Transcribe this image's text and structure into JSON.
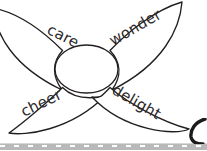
{
  "document": {
    "title": "Petal word diagram",
    "background_color": "#ffffff",
    "line_color": "#231f20",
    "text_color": "#2d2a2b"
  },
  "diagram": {
    "type": "four-petal flower word map",
    "center": {
      "label": "",
      "shape": "ellipse",
      "cx": 86.5,
      "cy": 69,
      "rx": 31.5,
      "ry": 24
    },
    "petals": [
      {
        "id": "petal-care",
        "label": "care",
        "position": "top-left",
        "rotation_deg": 27,
        "label_x": 46,
        "label_y": 33,
        "tip_x": -6,
        "tip_y": 9
      },
      {
        "id": "petal-wonder",
        "label": "wonder",
        "position": "top-right",
        "rotation_deg": -30,
        "label_x": 113,
        "label_y": 46,
        "tip_x": 181,
        "tip_y": 3
      },
      {
        "id": "petal-cheer",
        "label": "cheer",
        "position": "bottom-left",
        "rotation_deg": -26,
        "label_x": 24,
        "label_y": 117,
        "tip_x": 9,
        "tip_y": 133
      },
      {
        "id": "petal-delight",
        "label": "delight",
        "position": "bottom-right",
        "rotation_deg": 30,
        "label_x": 111,
        "label_y": 93,
        "tip_x": 189,
        "tip_y": 129
      }
    ]
  },
  "footer": {
    "strip_color": "#b9b9b9",
    "dash_color": "#ffffff",
    "y": 143,
    "height": 7
  },
  "corner_mark": {
    "name": "partial-circle-glyph",
    "color": "#1b1b1b",
    "x": 189,
    "y": 118,
    "width": 18,
    "height": 26
  }
}
